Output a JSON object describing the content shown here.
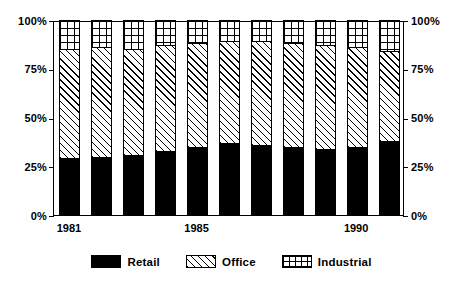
{
  "chart_data": {
    "type": "bar",
    "subtype": "stacked-100-percent",
    "title": "",
    "xlabel": "",
    "ylabel": "",
    "ylim": [
      0,
      100
    ],
    "grid": false,
    "legend_position": "bottom-center",
    "categories": [
      "1981",
      "1982",
      "1983",
      "1984",
      "1985",
      "1986",
      "1987",
      "1988",
      "1989",
      "1990",
      "1991"
    ],
    "x_tick_labels_shown": [
      "1981",
      "1985",
      "1990"
    ],
    "y_tick_labels": [
      "0%",
      "25%",
      "50%",
      "75%",
      "100%"
    ],
    "y_tick_values": [
      0,
      25,
      50,
      75,
      100
    ],
    "right_axis_tick_labels": [
      "0%",
      "25%",
      "50%",
      "75%",
      "100%"
    ],
    "series": [
      {
        "name": "Retail",
        "pattern": "solid-black",
        "color": "#000000",
        "values": [
          29,
          30,
          31,
          33,
          35,
          37,
          36,
          35,
          34,
          35,
          38
        ]
      },
      {
        "name": "Office",
        "pattern": "diagonal-hatch",
        "color": "#ffffff",
        "values": [
          56,
          56,
          54,
          54,
          53,
          52,
          53,
          53,
          53,
          51,
          46
        ]
      },
      {
        "name": "Industrial",
        "pattern": "cross-hatch",
        "color": "#ffffff",
        "values": [
          15,
          14,
          15,
          13,
          12,
          11,
          11,
          12,
          13,
          14,
          16
        ]
      }
    ]
  },
  "axis": {
    "left_ticks": [
      {
        "label": "100%",
        "value": 100
      },
      {
        "label": "75%",
        "value": 75
      },
      {
        "label": "50%",
        "value": 50
      },
      {
        "label": "25%",
        "value": 25
      },
      {
        "label": "0%",
        "value": 0
      }
    ],
    "right_ticks": [
      {
        "label": "100%",
        "value": 100
      },
      {
        "label": "75%",
        "value": 75
      },
      {
        "label": "50%",
        "value": 50
      },
      {
        "label": "25%",
        "value": 25
      },
      {
        "label": "0%",
        "value": 0
      }
    ],
    "x_ticks": [
      {
        "label": "1981",
        "index": 0
      },
      {
        "label": "1985",
        "index": 4
      },
      {
        "label": "1990",
        "index": 9
      }
    ]
  },
  "legend": {
    "items": [
      {
        "label": "Retail",
        "swatch": "solid-black-swatch"
      },
      {
        "label": "Office",
        "swatch": "diagonal-hatch-swatch"
      },
      {
        "label": "Industrial",
        "swatch": "cross-hatch-swatch"
      }
    ]
  }
}
